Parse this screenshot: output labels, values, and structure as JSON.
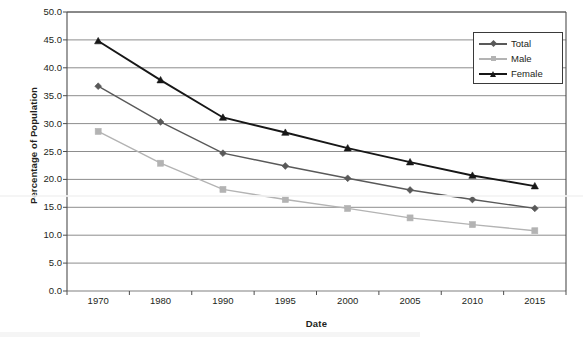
{
  "chart_data": {
    "type": "line",
    "title": "",
    "xlabel": "Date",
    "ylabel": "Percentage of Population",
    "categories": [
      "1970",
      "1980",
      "1990",
      "1995",
      "2000",
      "2005",
      "2010",
      "2015"
    ],
    "series": [
      {
        "name": "Total",
        "marker": "diamond",
        "color": "#595959",
        "values": [
          36.7,
          30.3,
          24.7,
          22.4,
          20.2,
          18.1,
          16.4,
          14.8
        ]
      },
      {
        "name": "Male",
        "marker": "square",
        "color": "#b3b3b3",
        "values": [
          28.6,
          22.9,
          18.2,
          16.4,
          14.8,
          13.1,
          11.9,
          10.8
        ]
      },
      {
        "name": "Female",
        "marker": "triangle",
        "color": "#171717",
        "values": [
          44.8,
          37.8,
          31.1,
          28.4,
          25.6,
          23.1,
          20.7,
          18.8
        ]
      }
    ],
    "ylim": [
      0.0,
      50.0
    ],
    "ytick_step": 5.0,
    "ytick_labels": [
      "0.0",
      "5.0",
      "10.0",
      "15.0",
      "20.0",
      "25.0",
      "30.0",
      "35.0",
      "40.0",
      "45.0",
      "50.0"
    ],
    "grid": "horizontal",
    "legend_position": "top-right",
    "legend_entries": [
      "Total",
      "Male",
      "Female"
    ],
    "colors": {
      "total": "#595959",
      "male": "#b3b3b3",
      "female": "#171717",
      "gridline": "#808080",
      "axis": "#4d4d4d",
      "text": "#231f20",
      "background": "#ffffff"
    }
  }
}
